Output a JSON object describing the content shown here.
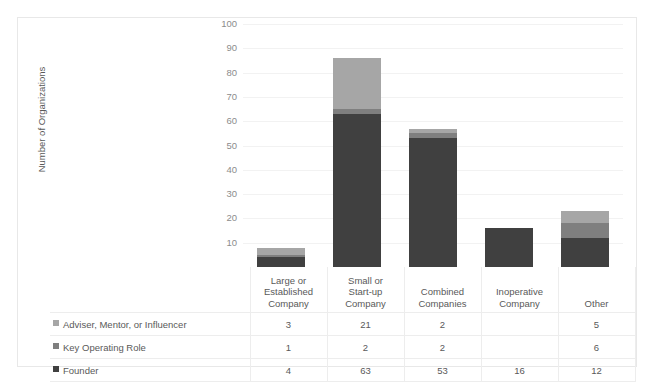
{
  "chart_data": {
    "type": "bar",
    "subtype": "stacked-column",
    "title": "",
    "xlabel": "",
    "ylabel": "Number of Organizations",
    "ylim": [
      0,
      100
    ],
    "yticks": [
      10,
      20,
      30,
      40,
      50,
      60,
      70,
      80,
      90,
      100
    ],
    "grid": true,
    "legend_position": "table-left",
    "categories": [
      "Large or Established Company",
      "Small or Start-up Company",
      "Combined Companies",
      "Inoperative Company",
      "Other"
    ],
    "category_lines": [
      [
        "Large or",
        "Established",
        "Company"
      ],
      [
        "Small or",
        "Start-up",
        "Company"
      ],
      [
        "Combined",
        "Companies"
      ],
      [
        "Inoperative",
        "Company"
      ],
      [
        "Other"
      ]
    ],
    "series": [
      {
        "name": "Adviser, Mentor, or Influencer",
        "color": "#a6a6a6",
        "values": [
          3,
          21,
          2,
          null,
          5
        ],
        "display": [
          "3",
          "21",
          "2",
          "",
          "5"
        ]
      },
      {
        "name": "Key Operating Role",
        "color": "#7f7f7f",
        "values": [
          1,
          2,
          2,
          null,
          6
        ],
        "display": [
          "1",
          "2",
          "2",
          "",
          "6"
        ]
      },
      {
        "name": "Founder",
        "color": "#404040",
        "values": [
          4,
          63,
          53,
          16,
          12
        ],
        "display": [
          "4",
          "63",
          "53",
          "16",
          "12"
        ]
      }
    ],
    "stack_order_bottom_to_top": [
      "Founder",
      "Key Operating Role",
      "Adviser, Mentor, or Influencer"
    ],
    "totals": [
      8,
      86,
      57,
      16,
      23
    ]
  },
  "colors": {
    "adviser": "#a6a6a6",
    "key_operating": "#7f7f7f",
    "founder": "#404040",
    "gridline": "#f2f2f2",
    "border": "#e8e8e8",
    "table_border": "#ededed",
    "text": "#595959",
    "tick_text": "#8c8c8c"
  }
}
